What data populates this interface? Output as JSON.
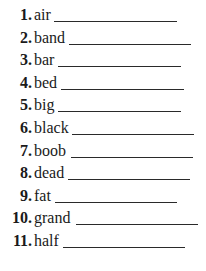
{
  "items": [
    {
      "num": "1.",
      "word": "air",
      "line_start": 54,
      "line_end": 177
    },
    {
      "num": "2.",
      "word": "band",
      "line_start": 69,
      "line_end": 191
    },
    {
      "num": "3.",
      "word": "bar",
      "line_start": 58,
      "line_end": 181
    },
    {
      "num": "4.",
      "word": "bed",
      "line_start": 61,
      "line_end": 184
    },
    {
      "num": "5.",
      "word": "big",
      "line_start": 58,
      "line_end": 181
    },
    {
      "num": "6.",
      "word": "black",
      "line_start": 72,
      "line_end": 194
    },
    {
      "num": "7.",
      "word": "boob",
      "line_start": 71,
      "line_end": 193
    },
    {
      "num": "8.",
      "word": "dead",
      "line_start": 68,
      "line_end": 190
    },
    {
      "num": "9.",
      "word": "fat",
      "line_start": 55,
      "line_end": 177
    },
    {
      "num": "10.",
      "word": "grand",
      "line_start": 76,
      "line_end": 198
    },
    {
      "num": "11.",
      "word": "half",
      "line_start": 63,
      "line_end": 185
    }
  ]
}
